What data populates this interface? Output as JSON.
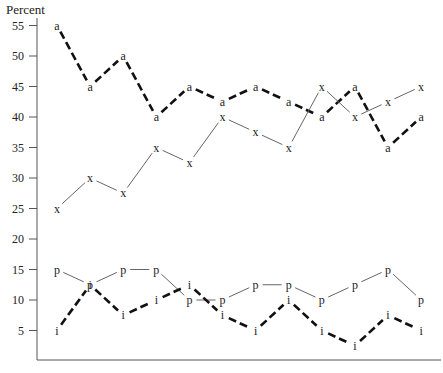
{
  "chart_data": {
    "type": "line",
    "title": "",
    "xlabel": "",
    "ylabel": "Percent",
    "ylim": [
      0,
      55
    ],
    "yticks": [
      5,
      10,
      15,
      20,
      25,
      30,
      35,
      40,
      45,
      50,
      55
    ],
    "grid": false,
    "legend": "none (series identified by point markers a, x, p, i)",
    "x": [
      1,
      2,
      3,
      4,
      5,
      6,
      7,
      8,
      9,
      10,
      11,
      12
    ],
    "x_tick_labels_visible": false,
    "series": [
      {
        "name": "a",
        "marker": "a",
        "style": "dashed-thick",
        "values": [
          55,
          45,
          50,
          40,
          45,
          42.5,
          45,
          42.5,
          40,
          45,
          35,
          40
        ]
      },
      {
        "name": "x",
        "marker": "x",
        "style": "solid-thin",
        "values": [
          25,
          30,
          27.5,
          35,
          32.5,
          40,
          37.5,
          35,
          45,
          40,
          42.5,
          45
        ]
      },
      {
        "name": "p",
        "marker": "p",
        "style": "solid-thin",
        "values": [
          15,
          12.5,
          15,
          15,
          10,
          10,
          12.5,
          12.5,
          10,
          12.5,
          15,
          10
        ]
      },
      {
        "name": "i",
        "marker": "i",
        "style": "dashed-thick",
        "values": [
          5,
          12.5,
          7.5,
          10,
          12.5,
          7.5,
          5,
          10,
          5,
          2.5,
          7.5,
          5
        ]
      }
    ]
  }
}
